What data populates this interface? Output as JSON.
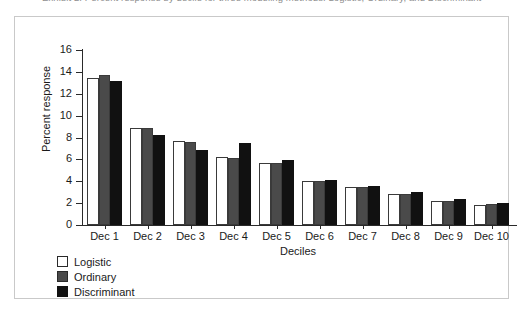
{
  "caption": {
    "text": "Exhibit 2. Percent response by decile for three modeling methods: Logistic, Ordinary, and Discriminant"
  },
  "chart_data": {
    "type": "bar",
    "title": "",
    "xlabel": "Deciles",
    "ylabel": "Percent response",
    "categories": [
      "Dec 1",
      "Dec 2",
      "Dec 3",
      "Dec 4",
      "Dec 5",
      "Dec 6",
      "Dec 7",
      "Dec 8",
      "Dec 9",
      "Dec 10"
    ],
    "series": [
      {
        "name": "Logistic",
        "color": "#ffffff",
        "values": [
          13.4,
          8.9,
          7.65,
          6.2,
          5.7,
          4.0,
          3.5,
          2.8,
          2.2,
          1.85
        ]
      },
      {
        "name": "Ordinary",
        "color": "#4a4a4a",
        "values": [
          13.7,
          8.85,
          7.55,
          6.15,
          5.7,
          4.0,
          3.5,
          2.8,
          2.2,
          1.9
        ]
      },
      {
        "name": "Discriminant",
        "color": "#111111",
        "values": [
          13.2,
          8.25,
          6.9,
          7.5,
          5.9,
          4.1,
          3.6,
          3.0,
          2.35,
          2.0
        ]
      }
    ],
    "ylim": [
      0,
      16
    ],
    "yticks": [
      0,
      2,
      4,
      6,
      8,
      10,
      12,
      14,
      16
    ],
    "ytick_labels": [
      "0",
      "2",
      "4",
      "6",
      "8",
      "10",
      "12",
      "14",
      "16"
    ],
    "grid": false,
    "legend_position": "below-left"
  }
}
